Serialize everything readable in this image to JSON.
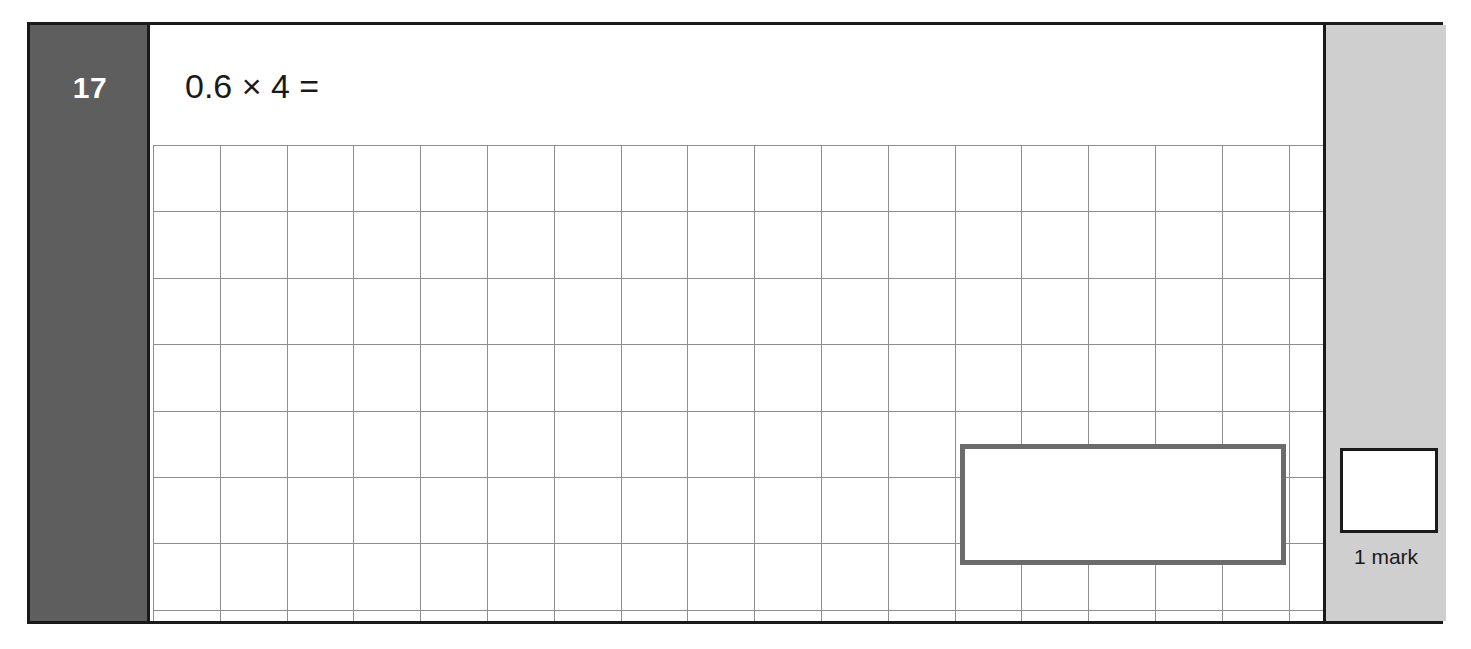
{
  "question": {
    "number": "17",
    "text": "0.6 × 4 =",
    "answer_value": ""
  },
  "marks": {
    "box_value": "",
    "label": "1 mark"
  },
  "colors": {
    "number_block": "#5e5e5e",
    "number_text": "#ffffff",
    "mark_column": "#cfcfcf",
    "answer_box_border": "#6b6b6b",
    "grid_line": "#8e8e8e",
    "frame_border": "#1a1a1a",
    "page_background": "#ffffff"
  },
  "grid": {
    "cell_size_px": 66,
    "columns": 18,
    "rows": 8
  }
}
